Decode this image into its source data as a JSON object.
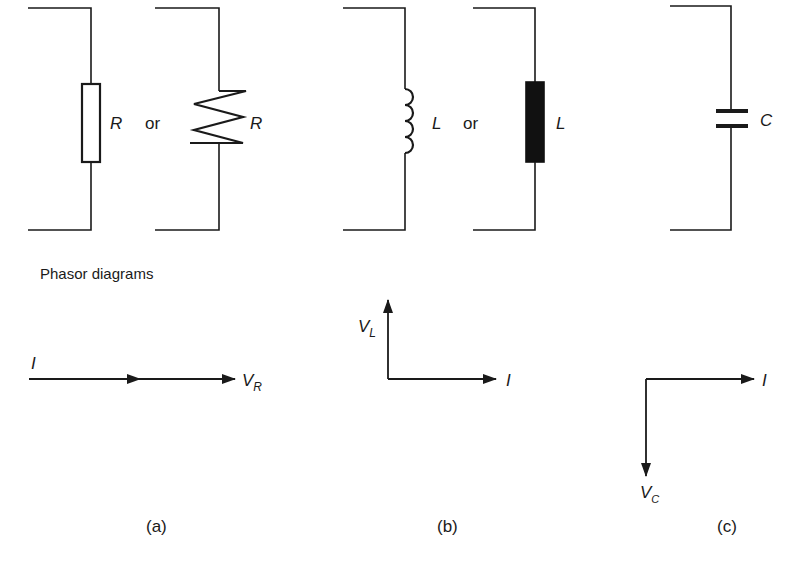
{
  "figure": {
    "phasor_title": "Phasor diagrams",
    "panels": [
      {
        "id": "a",
        "caption": "(a)",
        "component": "resistor",
        "symbols": [
          {
            "type": "rectangle-resistor",
            "label": "R"
          },
          {
            "type": "zigzag-resistor",
            "label": "R"
          }
        ],
        "or_label": "or",
        "phasor": {
          "current": {
            "label": "I",
            "direction": "right"
          },
          "voltage": {
            "label": "V",
            "subscript": "R",
            "direction": "right"
          },
          "relation": "in phase"
        }
      },
      {
        "id": "b",
        "caption": "(b)",
        "component": "inductor",
        "symbols": [
          {
            "type": "coil-inductor",
            "label": "L"
          },
          {
            "type": "solid-block-inductor",
            "label": "L"
          }
        ],
        "or_label": "or",
        "phasor": {
          "current": {
            "label": "I",
            "direction": "right"
          },
          "voltage": {
            "label": "V",
            "subscript": "L",
            "direction": "up"
          },
          "relation": "voltage leads current by 90°"
        }
      },
      {
        "id": "c",
        "caption": "(c)",
        "component": "capacitor",
        "symbols": [
          {
            "type": "capacitor",
            "label": "C"
          }
        ],
        "phasor": {
          "current": {
            "label": "I",
            "direction": "right"
          },
          "voltage": {
            "label": "V",
            "subscript": "C",
            "direction": "down"
          },
          "relation": "voltage lags current by 90°"
        }
      }
    ],
    "colors": {
      "stroke": "#1a1a1a",
      "background": "#ffffff"
    }
  }
}
